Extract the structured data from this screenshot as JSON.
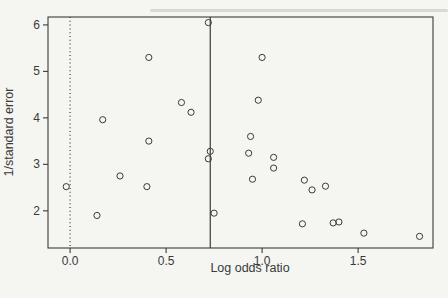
{
  "figure": {
    "xlabel": "Log odds ratio",
    "ylabel": "1/standard error"
  },
  "colors": {
    "background": "#f5f5f1",
    "ink": "#3a3a3a"
  },
  "chart_data": {
    "type": "scatter",
    "title": "",
    "xlabel": "Log odds ratio",
    "ylabel": "1/standard error",
    "marker": "open-circle",
    "grid": false,
    "xlim": [
      -0.115,
      1.89
    ],
    "ylim": [
      1.2,
      6.17
    ],
    "x_ticks": {
      "values": [
        0.0,
        0.5,
        1.0,
        1.5
      ],
      "labels": [
        "0.0",
        "0.5",
        "1.0",
        "1.5"
      ]
    },
    "y_ticks": {
      "values": [
        2,
        3,
        4,
        5,
        6
      ],
      "labels": [
        "2",
        "3",
        "4",
        "5",
        "6"
      ]
    },
    "reference_lines": [
      {
        "axis": "x",
        "value": 0.0,
        "style": "dotted"
      },
      {
        "axis": "x",
        "value": 0.73,
        "style": "solid"
      }
    ],
    "points": [
      [
        -0.02,
        2.52
      ],
      [
        0.14,
        1.9
      ],
      [
        0.17,
        3.96
      ],
      [
        0.26,
        2.75
      ],
      [
        0.4,
        2.52
      ],
      [
        0.41,
        3.5
      ],
      [
        0.41,
        5.3
      ],
      [
        0.58,
        4.33
      ],
      [
        0.63,
        4.12
      ],
      [
        0.72,
        6.05
      ],
      [
        0.72,
        3.12
      ],
      [
        0.73,
        3.28
      ],
      [
        0.75,
        1.95
      ],
      [
        0.93,
        3.24
      ],
      [
        0.94,
        3.6
      ],
      [
        0.95,
        2.68
      ],
      [
        0.98,
        4.38
      ],
      [
        1.0,
        5.3
      ],
      [
        1.06,
        3.15
      ],
      [
        1.06,
        2.92
      ],
      [
        1.21,
        1.72
      ],
      [
        1.22,
        2.66
      ],
      [
        1.26,
        2.45
      ],
      [
        1.33,
        2.53
      ],
      [
        1.37,
        1.74
      ],
      [
        1.4,
        1.76
      ],
      [
        1.53,
        1.52
      ],
      [
        1.82,
        1.45
      ]
    ]
  }
}
